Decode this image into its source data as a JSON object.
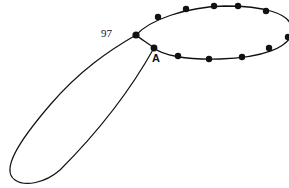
{
  "diagram": {
    "type": "closed-loop-with-dotted-ellipse",
    "labels": {
      "junction": "97",
      "point_a": "A"
    },
    "ellipse_dots": [
      {
        "x": 136,
        "y": 35,
        "role": "junction-97"
      },
      {
        "x": 158,
        "y": 17
      },
      {
        "x": 186,
        "y": 9
      },
      {
        "x": 214,
        "y": 6
      },
      {
        "x": 238,
        "y": 6
      },
      {
        "x": 266,
        "y": 11
      },
      {
        "x": 288,
        "y": 37
      },
      {
        "x": 269,
        "y": 48
      },
      {
        "x": 242,
        "y": 57
      },
      {
        "x": 209,
        "y": 59
      },
      {
        "x": 178,
        "y": 56
      },
      {
        "x": 154,
        "y": 48,
        "role": "point-A"
      }
    ],
    "colors": {
      "stroke": "#111111",
      "background": "#ffffff"
    }
  }
}
